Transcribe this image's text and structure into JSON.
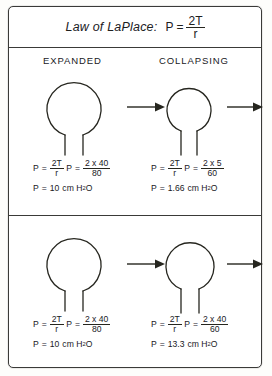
{
  "title": {
    "label": "Law of LaPlace:",
    "formula": {
      "lhs": "P",
      "eq": "=",
      "num": "2T",
      "den": "r"
    }
  },
  "headers": {
    "left": "EXPANDED",
    "right": "COLLAPSING"
  },
  "rows": [
    {
      "name": "row-unequal-radii",
      "left": {
        "bubble_label": "large-alveolus",
        "equations": [
          {
            "lhs": "P",
            "eq": "=",
            "num": "2T",
            "den": "r"
          },
          {
            "lhs": "P",
            "eq": "=",
            "num": "2 x 40",
            "den": "80"
          }
        ],
        "result": {
          "lhs": "P",
          "eq": "=",
          "value": "10",
          "unit": "cm H",
          "sub": "2",
          "unit_tail": "O"
        }
      },
      "right": {
        "bubble_label": "small-alveolus",
        "equations": [
          {
            "lhs": "P",
            "eq": "=",
            "num": "2T",
            "den": "r"
          },
          {
            "lhs": "P",
            "eq": "=",
            "num": "2 x 5",
            "den": "60"
          }
        ],
        "result": {
          "lhs": "P",
          "eq": "=",
          "value": "1.66",
          "unit": "cm H",
          "sub": "2",
          "unit_tail": "O"
        }
      }
    },
    {
      "name": "row-equal-tension",
      "left": {
        "bubble_label": "large-alveolus",
        "equations": [
          {
            "lhs": "P",
            "eq": "=",
            "num": "2T",
            "den": "r"
          },
          {
            "lhs": "P",
            "eq": "=",
            "num": "2 x 40",
            "den": "80"
          }
        ],
        "result": {
          "lhs": "P",
          "eq": "=",
          "value": "10",
          "unit": "cm H",
          "sub": "2",
          "unit_tail": "O"
        }
      },
      "right": {
        "bubble_label": "small-alveolus",
        "equations": [
          {
            "lhs": "P",
            "eq": "=",
            "num": "2T",
            "den": "r"
          },
          {
            "lhs": "P",
            "eq": "=",
            "num": "2 x 40",
            "den": "60"
          }
        ],
        "result": {
          "lhs": "P",
          "eq": "=",
          "value": "13.3",
          "unit": "cm H",
          "sub": "2",
          "unit_tail": "O"
        }
      }
    }
  ],
  "colors": {
    "ink": "#26261f",
    "border": "#3a3a38",
    "background": "#ffffff"
  }
}
